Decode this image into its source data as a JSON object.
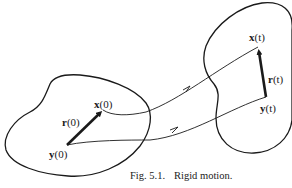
{
  "figure": {
    "caption": {
      "prefix": "Fig. 5.1.",
      "text": "Rigid motion."
    },
    "labels": {
      "x0": {
        "bold": "x",
        "arg": "(0)"
      },
      "r0": {
        "bold": "r",
        "arg": "(0)"
      },
      "y0": {
        "bold": "y",
        "arg": "(0)"
      },
      "xt": {
        "bold": "x",
        "arg": "(t)"
      },
      "rt": {
        "bold": "r",
        "arg": "(t)"
      },
      "yt": {
        "bold": "y",
        "arg": "(t)"
      }
    },
    "colors": {
      "stroke": "#1a1a1a",
      "background": "#ffffff"
    }
  }
}
